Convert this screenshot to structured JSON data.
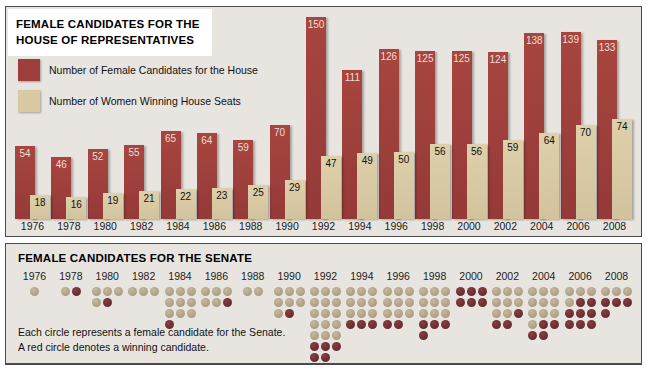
{
  "house_panel": {
    "title_line1": "FEMALE CANDIDATES FOR THE",
    "title_line2": "HOUSE OF REPRESENTATIVES",
    "legend": [
      {
        "label": "Number of Female Candidates for the House",
        "color": "#9f3f3c"
      },
      {
        "label": "Number of Women Winning House Seats",
        "color": "#d8c9a3"
      }
    ]
  },
  "senate_panel": {
    "title": "FEMALE CANDIDATES FOR THE SENATE",
    "footnote_line1": "Each circle represents a female candidate for the Senate.",
    "footnote_line2": "A red circle denotes a winning candidate.",
    "candidate_dot_color": "#b3a58a",
    "winner_dot_color": "#6e2e33"
  },
  "chart_data": [
    {
      "type": "bar",
      "title": "Female Candidates for the House of Representatives",
      "categories": [
        "1976",
        "1978",
        "1980",
        "1982",
        "1984",
        "1986",
        "1988",
        "1990",
        "1992",
        "1994",
        "1996",
        "1998",
        "2000",
        "2002",
        "2004",
        "2006",
        "2008"
      ],
      "series": [
        {
          "name": "Number of Female Candidates for the House",
          "color": "#9f3f3c",
          "values": [
            54,
            46,
            52,
            55,
            65,
            64,
            59,
            70,
            150,
            111,
            126,
            125,
            125,
            124,
            138,
            139,
            133
          ]
        },
        {
          "name": "Number of Women Winning House Seats",
          "color": "#d8c9a3",
          "values": [
            18,
            16,
            19,
            21,
            22,
            23,
            25,
            29,
            47,
            49,
            50,
            56,
            56,
            59,
            64,
            70,
            74
          ]
        }
      ],
      "xlabel": "",
      "ylabel": "",
      "ylim": [
        0,
        150
      ],
      "grid": false,
      "value_labels": true,
      "legend_position": "top-left"
    },
    {
      "type": "scatter",
      "variant": "unit-pictograph (each dot = one candidate, dark red dot = winner)",
      "title": "Female Candidates for the Senate",
      "categories": [
        "1976",
        "1978",
        "1980",
        "1982",
        "1984",
        "1986",
        "1988",
        "1990",
        "1992",
        "1994",
        "1996",
        "1998",
        "2000",
        "2002",
        "2004",
        "2006",
        "2008"
      ],
      "series": [
        {
          "name": "Female candidates for the Senate",
          "values": [
            1,
            2,
            5,
            3,
            10,
            6,
            2,
            8,
            20,
            12,
            11,
            13,
            6,
            11,
            14,
            12,
            7
          ]
        },
        {
          "name": "Winning candidates",
          "values": [
            0,
            1,
            1,
            0,
            1,
            1,
            0,
            1,
            5,
            3,
            2,
            4,
            6,
            3,
            4,
            8,
            4
          ]
        }
      ],
      "dots_per_row": 3,
      "winner_dot_rule": "winners are the last N dots of each year column",
      "legend_position": "none"
    }
  ]
}
